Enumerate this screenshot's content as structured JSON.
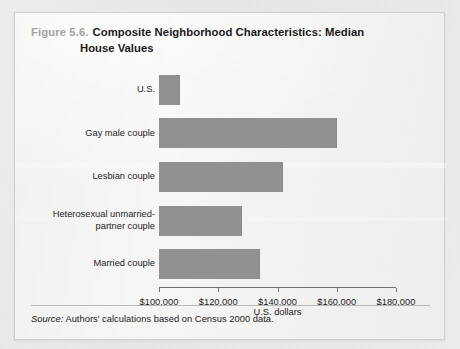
{
  "figure": {
    "number_label": "Figure 5.6.",
    "title_line1": "Composite Neighborhood Characteristics: Median",
    "title_line2": "House Values",
    "source_word": "Source:",
    "source_text": " Authors' calculations based on Census 2000 data."
  },
  "colors": {
    "bar": "#919191",
    "axis": "#6f6f6f",
    "figure_number": "#a3a3a0",
    "title": "#1b1b1b",
    "card_background": "#f2f2f0",
    "page_background": "#e9e9e7"
  },
  "chart_data": {
    "type": "bar",
    "orientation": "horizontal",
    "title": "Composite Neighborhood Characteristics: Median House Values",
    "xlabel": "U.S. dollars",
    "ylabel": "",
    "xlim": [
      100000,
      180000
    ],
    "xticks": [
      100000,
      120000,
      140000,
      160000,
      180000
    ],
    "xticklabels": [
      "$100,000",
      "$120,000",
      "$140,000",
      "$160,000",
      "$180,000"
    ],
    "grid": false,
    "legend": null,
    "categories": [
      "U.S.",
      "Gay male couple",
      "Lesbian couple",
      "Heterosexual unmarried-partner couple",
      "Married couple"
    ],
    "category_lines": [
      [
        "U.S."
      ],
      [
        "Gay male couple"
      ],
      [
        "Lesbian couple"
      ],
      [
        "Heterosexual unmarried-",
        "partner couple"
      ],
      [
        "Married couple"
      ]
    ],
    "values": [
      107000,
      160000,
      142000,
      128000,
      134000
    ],
    "value_unit": "U.S. dollars"
  }
}
